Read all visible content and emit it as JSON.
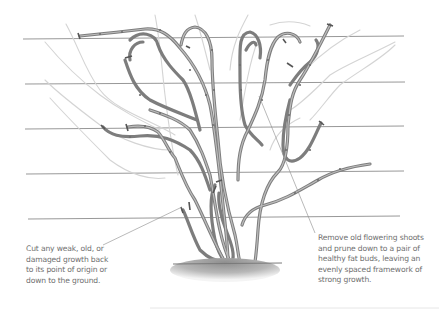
{
  "illustration": {
    "subject": "shrub trained on horizontal wires - pruning diagram",
    "wire_count": 5,
    "wires_y": [
      39,
      84,
      129,
      174,
      219
    ],
    "colors": {
      "background": "#ffffff",
      "stem": "#7d7d7d",
      "ghost_growth": "#d4d4d4",
      "wire": "#8c8c8c",
      "soil": "#9a9a9a",
      "text": "#6f6f6f"
    }
  },
  "annotations": {
    "left": {
      "text": "Cut any weak, old, or\ndamaged growth back\nto its point of origin or\ndown to the ground."
    },
    "right": {
      "text": "Remove old flowering shoots\nand prune down to a pair of\nhealthy fat buds, leaving an\nevenly spaced framework of\nstrong growth."
    }
  }
}
